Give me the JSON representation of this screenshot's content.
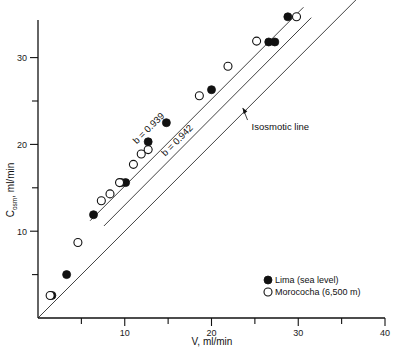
{
  "chart_data": {
    "type": "scatter",
    "title": "",
    "xlabel": "V, ml/min",
    "ylabel_main": "C",
    "ylabel_sub": "osm",
    "ylabel_tail": ", ml/min",
    "ylabel_full": "Cosm, ml/min",
    "xlim": [
      0,
      40
    ],
    "ylim": [
      0,
      36.5
    ],
    "grid": false,
    "legend_position": "bottom-right",
    "xticks_major": [
      10,
      20,
      30,
      40
    ],
    "xticks_minor": [
      5,
      15,
      25,
      35
    ],
    "yticks_major": [
      10,
      20,
      30
    ],
    "yticks_minor": [
      5,
      15,
      25,
      35
    ],
    "series": [
      {
        "name": "Lima (sea level)",
        "marker": "filled-circle",
        "color": "#111111",
        "points": [
          {
            "x": 1.6,
            "y": 2.6
          },
          {
            "x": 3.3,
            "y": 5.0
          },
          {
            "x": 6.4,
            "y": 11.9
          },
          {
            "x": 9.6,
            "y": 15.6
          },
          {
            "x": 10.1,
            "y": 15.6
          },
          {
            "x": 12.7,
            "y": 20.3
          },
          {
            "x": 14.8,
            "y": 22.5
          },
          {
            "x": 20.0,
            "y": 26.3
          },
          {
            "x": 26.6,
            "y": 31.8
          },
          {
            "x": 27.3,
            "y": 31.8
          },
          {
            "x": 28.8,
            "y": 34.7
          }
        ]
      },
      {
        "name": "Morococha (6,500 m)",
        "marker": "open-circle",
        "color": "#111111",
        "points": [
          {
            "x": 1.4,
            "y": 2.6
          },
          {
            "x": 4.6,
            "y": 8.7
          },
          {
            "x": 7.3,
            "y": 13.5
          },
          {
            "x": 8.3,
            "y": 14.3
          },
          {
            "x": 9.4,
            "y": 15.6
          },
          {
            "x": 11.0,
            "y": 17.7
          },
          {
            "x": 11.9,
            "y": 18.9
          },
          {
            "x": 12.7,
            "y": 19.4
          },
          {
            "x": 18.6,
            "y": 25.6
          },
          {
            "x": 21.9,
            "y": 29.0
          },
          {
            "x": 25.2,
            "y": 31.9
          },
          {
            "x": 29.8,
            "y": 34.7
          }
        ]
      }
    ],
    "fit_lines": [
      {
        "name": "upper-regression-line",
        "label": "b = 0.939",
        "slope_value": 0.939,
        "x_start": 6.0,
        "y_start": 11.2,
        "x_end": 30.6,
        "y_end": 35.8,
        "label_x": 13.0,
        "label_y": 21.6
      },
      {
        "name": "lower-regression-line",
        "label": "b = 0.942",
        "slope_value": 0.942,
        "x_start": 7.6,
        "y_start": 10.6,
        "x_end": 31.5,
        "y_end": 34.6,
        "label_x": 16.3,
        "label_y": 20.2
      }
    ],
    "reference_line": {
      "name": "isosmotic-line",
      "label": "Isosmotic line",
      "x_start": 0.0,
      "y_start": 0.0,
      "x_end": 40.0,
      "y_end": 40.0,
      "label_x": 26.0,
      "label_y": 22.0,
      "arrow_tip_x": 23.6,
      "arrow_tip_y": 24.2
    },
    "legend": [
      {
        "label": "Lima (sea level)",
        "marker": "filled-circle"
      },
      {
        "label": "Morococha (6,500 m)",
        "marker": "open-circle"
      }
    ]
  }
}
